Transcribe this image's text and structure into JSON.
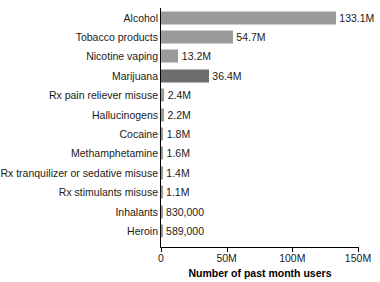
{
  "chart_data": {
    "type": "bar",
    "orientation": "horizontal",
    "title": "",
    "xlabel": "Number of past month users",
    "ylabel": "",
    "xlim": [
      0,
      150000000
    ],
    "grid": false,
    "legend": null,
    "categories": [
      "Alcohol",
      "Tobacco products",
      "Nicotine vaping",
      "Marijuana",
      "Rx pain reliever misuse",
      "Hallucinogens",
      "Cocaine",
      "Methamphetamine",
      "Rx tranquilizer or sedative misuse",
      "Rx stimulants misuse",
      "Inhalants",
      "Heroin"
    ],
    "values": [
      133100000,
      54700000,
      13200000,
      36400000,
      2400000,
      2200000,
      1800000,
      1600000,
      1400000,
      1100000,
      830000,
      589000
    ],
    "data_labels": [
      "133.1M",
      "54.7M",
      "13.2M",
      "36.4M",
      "2.4M",
      "2.2M",
      "1.8M",
      "1.6M",
      "1.4M",
      "1.1M",
      "830,000",
      "589,000"
    ],
    "highlight_index": 3,
    "bar_color": "#9a9a9a",
    "highlight_color": "#6e6e6e",
    "xticks": [
      0,
      50000000,
      100000000,
      150000000
    ],
    "xtick_labels": [
      "0",
      "50M",
      "100M",
      "150M"
    ]
  }
}
